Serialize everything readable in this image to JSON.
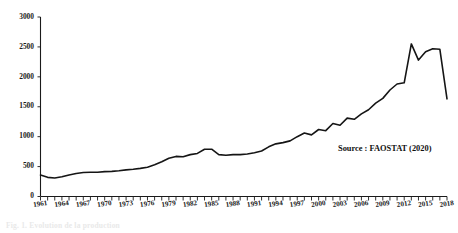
{
  "figure": {
    "source_note": "Source : FAOSTAT (2020)",
    "caption": "Fig. 1. Evolution de la production"
  },
  "chart_data": {
    "type": "line",
    "title": "",
    "xlabel": "",
    "ylabel": "",
    "xlim": [
      1961,
      2018
    ],
    "ylim": [
      0,
      3000
    ],
    "ytick_labels": [
      "0",
      "500",
      "1000",
      "1500",
      "2000",
      "2500",
      "3000"
    ],
    "ytick_values": [
      0,
      500,
      1000,
      1500,
      2000,
      2500,
      3000
    ],
    "xtick_labels": [
      "1961",
      "1964",
      "1967",
      "1970",
      "1973",
      "1976",
      "1979",
      "1982",
      "1985",
      "1988",
      "1991",
      "1994",
      "1997",
      "2000",
      "2003",
      "2006",
      "2009",
      "2012",
      "2015",
      "2018"
    ],
    "xtick_values": [
      1961,
      1964,
      1967,
      1970,
      1973,
      1976,
      1979,
      1982,
      1985,
      1988,
      1991,
      1994,
      1997,
      2000,
      2003,
      2006,
      2009,
      2012,
      2015,
      2018
    ],
    "minor_xticks_every": 1,
    "grid": false,
    "legend": false,
    "line_color": "#151515",
    "x": [
      1961,
      1962,
      1963,
      1964,
      1965,
      1966,
      1967,
      1968,
      1969,
      1970,
      1971,
      1972,
      1973,
      1974,
      1975,
      1976,
      1977,
      1978,
      1979,
      1980,
      1981,
      1982,
      1983,
      1984,
      1985,
      1986,
      1987,
      1988,
      1989,
      1990,
      1991,
      1992,
      1993,
      1994,
      1995,
      1996,
      1997,
      1998,
      1999,
      2000,
      2001,
      2002,
      2003,
      2004,
      2005,
      2006,
      2007,
      2008,
      2009,
      2010,
      2011,
      2012,
      2013,
      2014,
      2015,
      2016,
      2017,
      2018
    ],
    "values": [
      360,
      320,
      310,
      330,
      360,
      385,
      400,
      405,
      405,
      415,
      420,
      430,
      445,
      455,
      470,
      490,
      530,
      580,
      640,
      670,
      665,
      700,
      720,
      790,
      790,
      700,
      690,
      700,
      700,
      710,
      730,
      760,
      830,
      880,
      900,
      930,
      1000,
      1060,
      1030,
      1120,
      1100,
      1220,
      1190,
      1310,
      1290,
      1380,
      1450,
      1560,
      1640,
      1780,
      1880,
      1900,
      2550,
      2280,
      2420,
      2470,
      2460,
      1630
    ],
    "series": [
      {
        "name": "Production",
        "values": [
          360,
          320,
          310,
          330,
          360,
          385,
          400,
          405,
          405,
          415,
          420,
          430,
          445,
          455,
          470,
          490,
          530,
          580,
          640,
          670,
          665,
          700,
          720,
          790,
          790,
          700,
          690,
          700,
          700,
          710,
          730,
          760,
          830,
          880,
          900,
          930,
          1000,
          1060,
          1030,
          1120,
          1100,
          1220,
          1190,
          1310,
          1290,
          1380,
          1450,
          1560,
          1640,
          1780,
          1880,
          1900,
          2550,
          2280,
          2420,
          2470,
          2460,
          1630
        ]
      }
    ]
  }
}
